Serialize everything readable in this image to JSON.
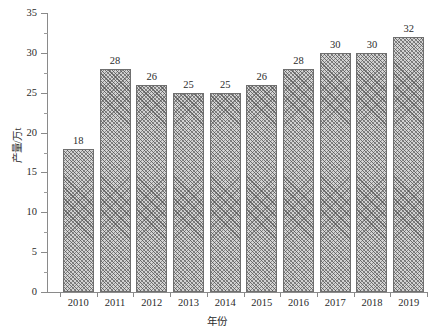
{
  "chart_data": {
    "type": "bar",
    "title": "",
    "xlabel": "年份",
    "ylabel": "产量/万t",
    "categories": [
      "2010",
      "2011",
      "2012",
      "2013",
      "2014",
      "2015",
      "2016",
      "2017",
      "2018",
      "2019"
    ],
    "values": [
      18,
      28,
      26,
      25,
      25,
      26,
      28,
      30,
      30,
      32
    ],
    "data_labels": [
      "18",
      "28",
      "26",
      "25",
      "25",
      "26",
      "28",
      "30",
      "30",
      "32"
    ],
    "ylim": [
      0,
      35
    ],
    "y_ticks": [
      0,
      5,
      10,
      15,
      20,
      25,
      30,
      35
    ],
    "y_tick_labels": [
      "0",
      "5",
      "10",
      "15",
      "20",
      "25",
      "30",
      "35"
    ],
    "y_minor_ticks": [
      2.5,
      7.5,
      12.5,
      17.5,
      22.5,
      27.5,
      32.5
    ],
    "grid": false,
    "legend": false,
    "series_name": "产量",
    "bar_fill": "#d3d3d3",
    "bar_edge": "#6f6f6f",
    "bar_hatch": "crosshatch-diagonal",
    "axis_color": "#8a8a8a",
    "text_color": "#2b2b2b"
  }
}
